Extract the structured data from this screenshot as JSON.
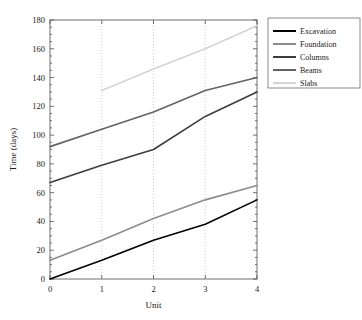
{
  "chart_data": {
    "type": "line",
    "title": "",
    "xlabel": "Unit",
    "ylabel": "Time (days)",
    "x": [
      0,
      1,
      2,
      3,
      4
    ],
    "xlim": [
      0,
      4
    ],
    "ylim": [
      0,
      180
    ],
    "xticks": [
      "0",
      "1",
      "2",
      "3",
      "4"
    ],
    "yticks": [
      "0",
      "20",
      "40",
      "60",
      "80",
      "100",
      "120",
      "140",
      "160",
      "180"
    ],
    "grid": "vertical-dotted",
    "legend_position": "right-outside",
    "series": [
      {
        "name": "Excavation",
        "color": "#000000",
        "x": [
          0,
          1,
          2,
          3,
          4
        ],
        "values": [
          0,
          13,
          27,
          38,
          55
        ]
      },
      {
        "name": "Foundation",
        "color": "#8c8c8c",
        "x": [
          0,
          1,
          2,
          3,
          4
        ],
        "values": [
          13,
          27,
          42,
          55,
          65
        ]
      },
      {
        "name": "Columns",
        "color": "#3d3d3d",
        "x": [
          0,
          1,
          2,
          3,
          4
        ],
        "values": [
          67,
          79,
          90,
          113,
          130
        ]
      },
      {
        "name": "Beams",
        "color": "#636363",
        "x": [
          0,
          1,
          2,
          3,
          4
        ],
        "values": [
          92,
          104,
          116,
          131,
          140
        ]
      },
      {
        "name": "Slabs",
        "color": "#d4d4d4",
        "x": [
          1,
          2,
          3,
          4
        ],
        "values": [
          131,
          146,
          160,
          176
        ]
      }
    ]
  },
  "axes": {
    "x_label": "Unit",
    "y_label": "Time (days)",
    "x_tick_labels": [
      "0",
      "1",
      "2",
      "3",
      "4"
    ],
    "y_tick_labels": [
      "0",
      "20",
      "40",
      "60",
      "80",
      "100",
      "120",
      "140",
      "160",
      "180"
    ]
  },
  "legend": {
    "items": [
      {
        "label": "Excavation",
        "color": "#000000"
      },
      {
        "label": "Foundation",
        "color": "#8c8c8c"
      },
      {
        "label": "Columns",
        "color": "#3d3d3d"
      },
      {
        "label": "Beams",
        "color": "#636363"
      },
      {
        "label": "Slabs",
        "color": "#d4d4d4"
      }
    ]
  }
}
